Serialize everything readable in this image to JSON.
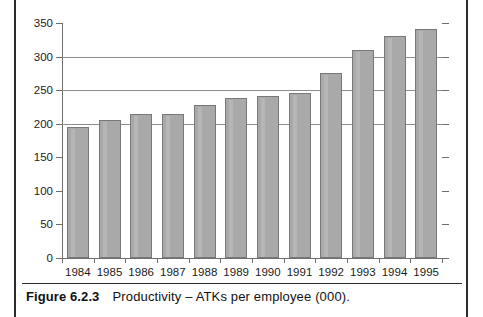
{
  "figure": {
    "caption_label": "Figure 6.2.3",
    "caption_text": "Productivity – ATKs per employee (000)."
  },
  "chart_data": {
    "type": "bar",
    "title": "Productivity – ATKs per employee (000)",
    "xlabel": "",
    "ylabel": "",
    "categories": [
      "1984",
      "1985",
      "1986",
      "1987",
      "1988",
      "1989",
      "1990",
      "1991",
      "1992",
      "1993",
      "1994",
      "1995"
    ],
    "values": [
      195,
      205,
      214,
      214,
      228,
      238,
      242,
      246,
      275,
      310,
      330,
      341
    ],
    "ylim": [
      0,
      350
    ],
    "yticks": [
      0,
      50,
      100,
      150,
      200,
      250,
      300,
      350
    ],
    "ytick_labels": [
      "0",
      "50",
      "100",
      "150",
      "200",
      "250",
      "300",
      "350"
    ],
    "grid": true,
    "gridlines_at": [
      200,
      250,
      300
    ],
    "legend": null,
    "bar_color": "#a9a9a9",
    "bar_edge_color": "#787878",
    "axis_color": "#6f6f6f",
    "grid_color": "#8d8d8d"
  }
}
